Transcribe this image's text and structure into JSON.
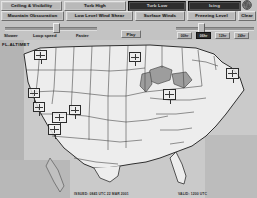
{
  "app": {
    "title": "Aviation Weather Forecast Viewer"
  },
  "toolbar": {
    "row1": [
      {
        "label": "Ceiling & Visibility",
        "name": "ceiling-visibility",
        "selected": false
      },
      {
        "label": "Turb High",
        "name": "turb-high",
        "selected": false
      },
      {
        "label": "Turb Low",
        "name": "turb-low",
        "selected": true
      },
      {
        "label": "Icing",
        "name": "icing",
        "selected": true
      }
    ],
    "row2": [
      {
        "label": "Mountain Obscuration",
        "name": "mountain-obscuration",
        "selected": false
      },
      {
        "label": "Low Level Wind Shear",
        "name": "low-level-wind-shear",
        "selected": false
      },
      {
        "label": "Surface Winds",
        "name": "surface-winds",
        "selected": false
      },
      {
        "label": "Freezing Level",
        "name": "freezing-level",
        "selected": false
      },
      {
        "label": "Clear",
        "name": "clear",
        "selected": false
      }
    ],
    "logo_icon": "globe-icon"
  },
  "controls": {
    "loop_slider": {
      "label_min": "Slower",
      "label_center": "Loop speed",
      "label_max": "Faster",
      "value": 52
    },
    "play_label": "Play",
    "frame_slider": {
      "value": 28
    },
    "frames": [
      {
        "label": "00hr",
        "selected": false
      },
      {
        "label": "06hr",
        "selected": true
      },
      {
        "label": "12hr",
        "selected": false
      },
      {
        "label": "24hr",
        "selected": false
      }
    ]
  },
  "map": {
    "title": "FL-ALTIMET",
    "timestamp_left": "ISSUED: 0845 UTC 22 MAR 2001",
    "timestamp_right": "VALID: 1200 UTC",
    "region": "Continental United States",
    "accent_selected": "#2e2e2e",
    "background": "#c9c9c9",
    "stations": [
      {
        "name": "station-nw-washington",
        "x": 34,
        "y": 10,
        "w": 13,
        "h": 10
      },
      {
        "name": "station-w-montana",
        "x": 28,
        "y": 48,
        "w": 12,
        "h": 10
      },
      {
        "name": "station-n-california",
        "x": 33,
        "y": 62,
        "w": 12,
        "h": 10
      },
      {
        "name": "station-c-nevada",
        "x": 52,
        "y": 72,
        "w": 15,
        "h": 11
      },
      {
        "name": "station-s-utah",
        "x": 69,
        "y": 65,
        "w": 12,
        "h": 10
      },
      {
        "name": "station-s-california",
        "x": 48,
        "y": 84,
        "w": 13,
        "h": 11
      },
      {
        "name": "station-n-dakota",
        "x": 129,
        "y": 12,
        "w": 12,
        "h": 10
      },
      {
        "name": "station-illinois",
        "x": 163,
        "y": 49,
        "w": 13,
        "h": 11
      },
      {
        "name": "station-northeast",
        "x": 226,
        "y": 28,
        "w": 13,
        "h": 11
      }
    ]
  }
}
